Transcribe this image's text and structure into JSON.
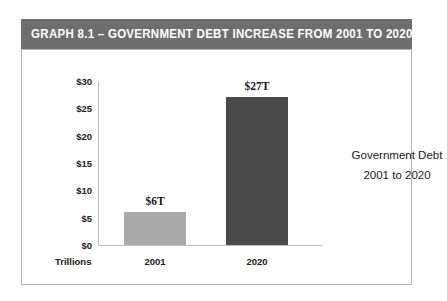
{
  "title_bar": {
    "text": "GRAPH 8.1 – GOVERNMENT DEBT INCREASE FROM 2001 TO 2020",
    "background_color": "#6e6e6e",
    "text_color": "#ffffff"
  },
  "annotation": {
    "line1": "Government Debt",
    "line2": "2001 to 2020"
  },
  "axis_unit_label": "Trillions",
  "chart_data": {
    "type": "bar",
    "title": "GRAPH 8.1 – GOVERNMENT DEBT INCREASE FROM 2001 TO 2020",
    "subtitle": "",
    "xlabel": "",
    "ylabel": "Trillions",
    "categories": [
      "2001",
      "2020"
    ],
    "values": [
      6,
      27
    ],
    "value_labels": [
      "$6T",
      "$27T"
    ],
    "bar_colors": [
      "#a9a9a9",
      "#4a4a4a"
    ],
    "ylim": [
      0,
      30
    ],
    "yticks": [
      0,
      5,
      10,
      15,
      20,
      25,
      30
    ],
    "ytick_labels": [
      "$0",
      "$5",
      "$10",
      "$15",
      "$20",
      "$25",
      "$30"
    ],
    "grid": false,
    "legend": false,
    "annotations": [
      "Government Debt",
      "2001 to 2020"
    ]
  }
}
